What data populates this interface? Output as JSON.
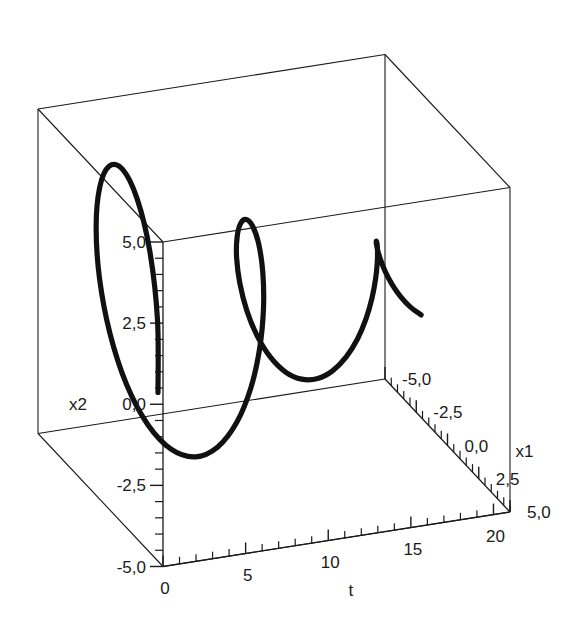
{
  "figure": {
    "kind": "3d-line-plot",
    "background_color": "#ffffff",
    "curve_color": "#111111",
    "axis_color": "#1a1a1a"
  },
  "axes": {
    "t": {
      "label": "t",
      "ticks": [
        "0",
        "5",
        "10",
        "15",
        "20"
      ],
      "tick_values": [
        0,
        5,
        10,
        15,
        20
      ],
      "range": [
        0,
        21
      ],
      "minor_per_major": 5
    },
    "x1": {
      "label": "x1",
      "ticks": [
        "5,0",
        "2,5",
        "0,0",
        "-2,5",
        "-5,0"
      ],
      "tick_values": [
        5.0,
        2.5,
        0.0,
        -2.5,
        -5.0
      ],
      "range": [
        -5,
        5
      ],
      "minor_per_major": 5
    },
    "x2": {
      "label": "x2",
      "ticks": [
        "5,0",
        "2,5",
        "0,0",
        "-2,5",
        "-5,0"
      ],
      "tick_values": [
        5.0,
        2.5,
        0.0,
        -2.5,
        -5.0
      ],
      "range": [
        -5,
        5
      ],
      "minor_per_major": 5
    }
  },
  "chart_data": {
    "type": "line",
    "title": "",
    "xlabel": "t",
    "ylabel": "x1",
    "zlabel": "x2",
    "xlim": [
      0,
      21
    ],
    "ylim": [
      -5,
      5
    ],
    "zlim": [
      -5,
      5
    ],
    "grid": false,
    "legend": "none",
    "projection": "3d",
    "series": [
      {
        "name": "trajectory",
        "description": "Decaying 3D helix: oscillatory orbit in (x1,x2) advancing along t",
        "t": [
          0.0,
          0.4,
          0.8,
          1.2,
          1.6,
          2.0,
          2.4,
          2.8,
          3.2,
          3.6,
          4.0,
          4.4,
          4.8,
          5.2,
          5.6,
          6.0,
          6.4,
          6.8,
          7.2,
          7.6,
          8.0,
          8.4,
          8.8,
          9.2,
          9.6,
          10.0,
          10.4,
          10.8,
          11.2,
          11.6,
          12.0,
          12.4,
          12.8,
          13.2,
          13.6,
          14.0,
          14.4,
          14.8,
          15.2,
          15.6,
          16.0,
          16.4,
          16.8,
          17.2,
          17.6,
          18.0,
          18.4,
          18.8,
          19.2,
          19.6,
          20.0
        ],
        "x1": [
          4.6,
          4.03,
          2.88,
          1.34,
          -0.36,
          -1.96,
          -3.24,
          -4.05,
          -4.31,
          -4.01,
          -3.21,
          -2.04,
          -0.67,
          0.72,
          1.98,
          2.96,
          3.56,
          3.74,
          3.52,
          2.94,
          2.09,
          1.08,
          0.03,
          -0.95,
          -1.76,
          -2.33,
          -2.6,
          -2.57,
          -2.27,
          -1.74,
          -1.06,
          -0.3,
          0.46,
          1.14,
          1.68,
          2.05,
          2.21,
          2.16,
          1.92,
          1.52,
          1.01,
          0.44,
          -0.14,
          -0.67,
          -1.1,
          -1.4,
          -1.55,
          -1.54,
          -1.39,
          -1.13,
          -0.79
        ],
        "x2": [
          0.2,
          2.18,
          3.8,
          4.74,
          4.92,
          4.32,
          3.11,
          1.52,
          -0.19,
          -1.79,
          -3.07,
          -3.86,
          -4.1,
          -3.79,
          -3.0,
          -1.88,
          -0.61,
          0.65,
          1.76,
          2.6,
          3.09,
          3.2,
          2.95,
          2.4,
          1.62,
          0.71,
          -0.22,
          -1.08,
          -1.77,
          -2.24,
          -2.45,
          -2.39,
          -2.09,
          -1.6,
          -0.99,
          -0.32,
          0.34,
          0.93,
          1.4,
          1.7,
          1.83,
          1.78,
          1.58,
          1.26,
          0.85,
          0.4,
          -0.06,
          -0.48,
          -0.83,
          -1.08,
          -1.22
        ]
      }
    ]
  }
}
